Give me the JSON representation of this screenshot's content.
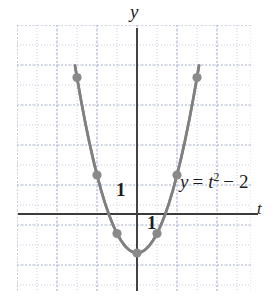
{
  "figure": {
    "background_color": "#ffffff",
    "curve_color": "#808080",
    "point_color": "#8a8a8a",
    "axis_color": "#3b3b3b",
    "grid_color": "#c9cfe0"
  },
  "labels": {
    "y_axis": "y",
    "t_axis": "t",
    "unit_y": "1",
    "unit_t": "1",
    "equation_lhs": "y",
    "equation_eq": "=",
    "equation_var": "t",
    "equation_exp": "2",
    "equation_minus": "−",
    "equation_const": "2",
    "equation_full": "y = t² − 2"
  },
  "chart_data": {
    "type": "line",
    "title": "",
    "subtitle": "",
    "xlabel": "t",
    "ylabel": "y",
    "annotations": [
      "y = t² − 2",
      "1",
      "1"
    ],
    "grid": true,
    "grid_major_step": 2,
    "grid_minor_step": 1,
    "legend": "none",
    "xlim": [
      -6,
      6
    ],
    "ylim": [
      -4,
      10
    ],
    "curve": {
      "name": "y = t^2 - 2",
      "equation": "y = t^2 - 2",
      "x": [
        -3.1,
        -3.0,
        -2.8,
        -2.6,
        -2.4,
        -2.2,
        -2.0,
        -1.8,
        -1.6,
        -1.4,
        -1.2,
        -1.0,
        -0.8,
        -0.6,
        -0.4,
        -0.2,
        0.0,
        0.2,
        0.4,
        0.6,
        0.8,
        1.0,
        1.2,
        1.4,
        1.6,
        1.8,
        2.0,
        2.2,
        2.4,
        2.6,
        2.8,
        3.0,
        3.1
      ],
      "y": [
        7.61,
        7.0,
        5.84,
        4.76,
        3.76,
        2.84,
        2.0,
        1.24,
        0.56,
        -0.04,
        -0.56,
        -1.0,
        -1.36,
        -1.64,
        -1.84,
        -1.96,
        -2.0,
        -1.96,
        -1.84,
        -1.64,
        -1.36,
        -1.0,
        -0.56,
        -0.04,
        0.56,
        1.24,
        2.0,
        2.84,
        3.76,
        4.76,
        5.84,
        7.0,
        7.61
      ]
    },
    "marked_points": [
      {
        "t": -2.0,
        "y": 2.0
      },
      {
        "t": -1.0,
        "y": -1.0
      },
      {
        "t": 0.0,
        "y": -2.0
      },
      {
        "t": 1.0,
        "y": -1.0
      },
      {
        "t": 2.0,
        "y": 2.0
      },
      {
        "t": -3.0,
        "y": 7.0
      },
      {
        "t": 3.0,
        "y": 7.0
      }
    ],
    "pixel_mapping": {
      "origin_x_px": 137,
      "origin_y_px": 214,
      "unit_px_x": 20,
      "unit_px_y": 19.5
    }
  }
}
